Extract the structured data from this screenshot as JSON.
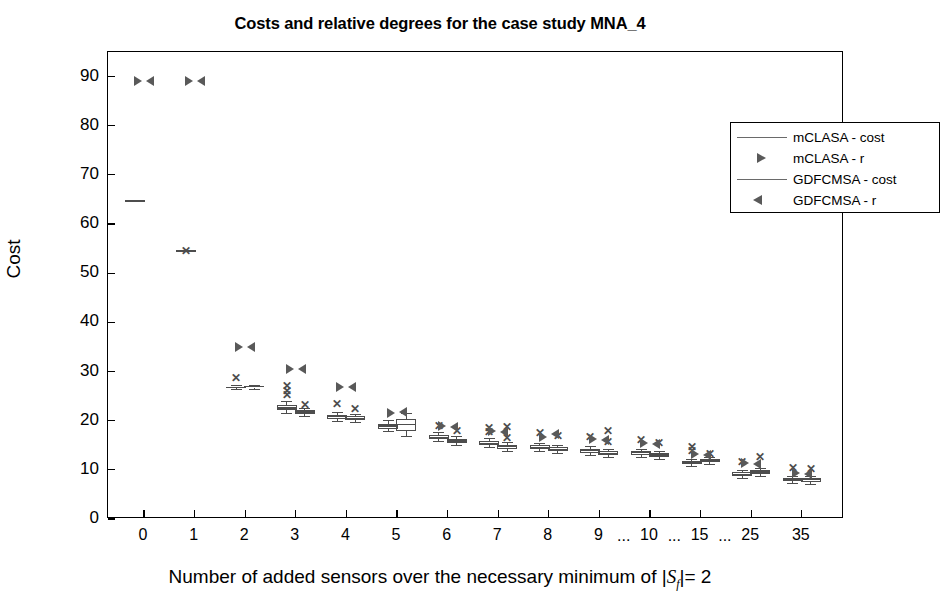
{
  "chart_data": {
    "type": "box",
    "title": "Costs and relative degrees for the case study MNA_4",
    "xlabel": "Number of added sensors over the necessary minimum of |S_f|= 2",
    "ylabel": "Cost",
    "ylim": [
      0,
      95
    ],
    "yticks": [
      0,
      10,
      20,
      30,
      40,
      50,
      60,
      70,
      80,
      90
    ],
    "xtick_labels": [
      "0",
      "1",
      "2",
      "3",
      "4",
      "5",
      "6",
      "7",
      "8",
      "9",
      "10",
      "15",
      "25",
      "35"
    ],
    "xtick_separators": [
      "...",
      "...",
      "..."
    ],
    "grid": false,
    "legend_position": "top-right",
    "legend": [
      {
        "label": "mCLASA - cost",
        "marker": "line"
      },
      {
        "label": "mCLASA - r",
        "marker": "triangle-right"
      },
      {
        "label": "GDFCMSA - cost",
        "marker": "line"
      },
      {
        "label": "GDFCMSA - r",
        "marker": "triangle-left"
      }
    ],
    "series": [
      {
        "name": "mCLASA - cost",
        "type": "box",
        "boxes": [
          {
            "x": 0,
            "q1": 64.7,
            "median": 64.7,
            "q3": 64.7,
            "lo": 64.7,
            "hi": 64.7,
            "outliers": []
          },
          {
            "x": 1,
            "q1": 54.5,
            "median": 54.5,
            "q3": 54.5,
            "lo": 54.5,
            "hi": 54.5,
            "outliers": [
              54.5
            ]
          },
          {
            "x": 2,
            "q1": 26.6,
            "median": 26.8,
            "q3": 27.0,
            "lo": 26.4,
            "hi": 27.2,
            "outliers": [
              28.6
            ]
          },
          {
            "x": 3,
            "q1": 22.2,
            "median": 22.6,
            "q3": 23.2,
            "lo": 21.6,
            "hi": 24.0,
            "outliers": [
              25.2,
              26.1,
              27.0
            ]
          },
          {
            "x": 4,
            "q1": 20.4,
            "median": 20.8,
            "q3": 21.2,
            "lo": 20.0,
            "hi": 21.8,
            "outliers": [
              23.4
            ]
          },
          {
            "x": 5,
            "q1": 18.4,
            "median": 18.9,
            "q3": 19.4,
            "lo": 17.8,
            "hi": 20.2,
            "outliers": []
          },
          {
            "x": 6,
            "q1": 16.2,
            "median": 16.6,
            "q3": 17.0,
            "lo": 15.8,
            "hi": 17.6,
            "outliers": [
              19.0
            ]
          },
          {
            "x": 7,
            "q1": 15.0,
            "median": 15.4,
            "q3": 15.9,
            "lo": 14.6,
            "hi": 16.4,
            "outliers": [
              18.6,
              17.6
            ]
          },
          {
            "x": 8,
            "q1": 14.3,
            "median": 14.6,
            "q3": 15.0,
            "lo": 13.9,
            "hi": 15.5,
            "outliers": [
              17.4
            ]
          },
          {
            "x": 9,
            "q1": 13.5,
            "median": 13.9,
            "q3": 14.3,
            "lo": 13.1,
            "hi": 14.8,
            "outliers": [
              16.6
            ]
          },
          {
            "x": 10,
            "q1": 13.1,
            "median": 13.5,
            "q3": 13.9,
            "lo": 12.7,
            "hi": 14.3,
            "outliers": [
              16.0
            ]
          },
          {
            "x": 11,
            "q1": 11.1,
            "median": 11.4,
            "q3": 11.8,
            "lo": 10.7,
            "hi": 12.2,
            "outliers": [
              13.8,
              14.6
            ]
          },
          {
            "x": 12,
            "q1": 8.8,
            "median": 9.1,
            "q3": 9.5,
            "lo": 8.4,
            "hi": 9.9,
            "outliers": [
              11.6
            ]
          },
          {
            "x": 13,
            "q1": 7.8,
            "median": 8.1,
            "q3": 8.4,
            "lo": 7.4,
            "hi": 8.8,
            "outliers": [
              10.4
            ]
          }
        ]
      },
      {
        "name": "GDFCMSA - cost",
        "type": "box",
        "boxes": [
          {
            "x": 2,
            "q1": 26.7,
            "median": 26.9,
            "q3": 27.1,
            "lo": 26.5,
            "hi": 27.3,
            "outliers": []
          },
          {
            "x": 3,
            "q1": 21.4,
            "median": 21.8,
            "q3": 22.2,
            "lo": 21.0,
            "hi": 22.6,
            "outliers": [
              23.2
            ]
          },
          {
            "x": 4,
            "q1": 20.1,
            "median": 20.5,
            "q3": 20.9,
            "lo": 19.7,
            "hi": 21.3,
            "outliers": [
              22.4
            ]
          },
          {
            "x": 5,
            "q1": 18.0,
            "median": 19.3,
            "q3": 20.4,
            "lo": 16.8,
            "hi": 21.6,
            "outliers": []
          },
          {
            "x": 6,
            "q1": 15.5,
            "median": 15.9,
            "q3": 16.3,
            "lo": 15.1,
            "hi": 16.8,
            "outliers": [
              18.0
            ]
          },
          {
            "x": 7,
            "q1": 14.3,
            "median": 14.7,
            "q3": 15.1,
            "lo": 13.9,
            "hi": 15.6,
            "outliers": [
              16.4,
              18.8
            ]
          },
          {
            "x": 8,
            "q1": 13.8,
            "median": 14.2,
            "q3": 14.6,
            "lo": 13.4,
            "hi": 15.0,
            "outliers": [
              16.8
            ]
          },
          {
            "x": 9,
            "q1": 13.0,
            "median": 13.4,
            "q3": 13.8,
            "lo": 12.6,
            "hi": 14.2,
            "outliers": [
              15.6,
              17.8
            ]
          },
          {
            "x": 10,
            "q1": 12.6,
            "median": 13.0,
            "q3": 13.4,
            "lo": 12.2,
            "hi": 13.8,
            "outliers": [
              15.4
            ]
          },
          {
            "x": 11,
            "q1": 11.5,
            "median": 11.9,
            "q3": 12.3,
            "lo": 11.1,
            "hi": 12.7,
            "outliers": [
              13.2
            ]
          },
          {
            "x": 12,
            "q1": 9.2,
            "median": 9.6,
            "q3": 10.0,
            "lo": 8.8,
            "hi": 10.4,
            "outliers": [
              12.6
            ]
          },
          {
            "x": 13,
            "q1": 7.6,
            "median": 8.0,
            "q3": 8.4,
            "lo": 7.2,
            "hi": 8.8,
            "outliers": [
              10.2
            ]
          }
        ]
      },
      {
        "name": "mCLASA - r",
        "type": "triangle-right",
        "points": [
          {
            "x": 0,
            "y": 89.0
          },
          {
            "x": 1,
            "y": 89.0
          },
          {
            "x": 2,
            "y": 35.0
          },
          {
            "x": 3,
            "y": 30.6
          },
          {
            "x": 4,
            "y": 26.8
          },
          {
            "x": 5,
            "y": 21.6
          },
          {
            "x": 6,
            "y": 19.0
          },
          {
            "x": 7,
            "y": 18.0
          },
          {
            "x": 8,
            "y": 16.6
          },
          {
            "x": 9,
            "y": 16.2
          },
          {
            "x": 10,
            "y": 15.4
          },
          {
            "x": 11,
            "y": 13.2
          },
          {
            "x": 12,
            "y": 11.4
          },
          {
            "x": 13,
            "y": 9.4
          }
        ]
      },
      {
        "name": "GDFCMSA - r",
        "type": "triangle-left",
        "points": [
          {
            "x": 0,
            "y": 89.0
          },
          {
            "x": 1,
            "y": 89.0
          },
          {
            "x": 2,
            "y": 35.0
          },
          {
            "x": 3,
            "y": 30.6
          },
          {
            "x": 4,
            "y": 26.8
          },
          {
            "x": 5,
            "y": 21.8
          },
          {
            "x": 6,
            "y": 18.8
          },
          {
            "x": 7,
            "y": 17.6
          },
          {
            "x": 8,
            "y": 17.2
          },
          {
            "x": 9,
            "y": 16.0
          },
          {
            "x": 10,
            "y": 15.2
          },
          {
            "x": 11,
            "y": 13.0
          },
          {
            "x": 12,
            "y": 11.2
          },
          {
            "x": 13,
            "y": 9.2
          }
        ]
      }
    ]
  }
}
